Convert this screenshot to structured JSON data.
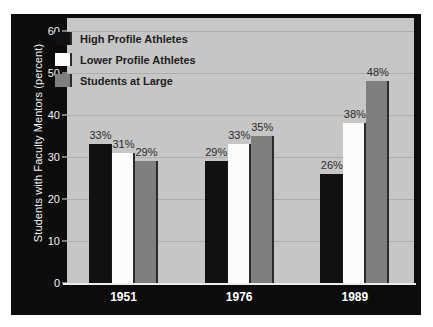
{
  "chart_data": {
    "type": "bar",
    "title": "",
    "subtitle": "",
    "xlabel": "",
    "ylabel": "Students with Faculty Mentors (percent)",
    "categories": [
      "1951",
      "1976",
      "1989"
    ],
    "series": [
      {
        "name": "High Profile Athletes",
        "color": "#111111",
        "values": [
          33,
          29,
          26
        ],
        "labels": [
          "33%",
          "29%",
          "26%"
        ]
      },
      {
        "name": "Lower Profile Athletes",
        "color": "#fbfbfb",
        "values": [
          31,
          33,
          38
        ],
        "labels": [
          "31%",
          "33%",
          "38%"
        ]
      },
      {
        "name": "Students at Large",
        "color": "#7f7f7f",
        "values": [
          29,
          35,
          48
        ],
        "labels": [
          "29%",
          "35%",
          "48%"
        ]
      }
    ],
    "ylim": [
      0,
      63
    ],
    "yticks": [
      0,
      10,
      20,
      30,
      40,
      50,
      60
    ],
    "ytick_labels": [
      "0",
      "10",
      "20",
      "30",
      "40",
      "50",
      "60"
    ],
    "grid": true,
    "grid_axis": "y",
    "legend_position": "upper left",
    "plot_background": "#c6c6c6",
    "panel_background": "#0c0c0c",
    "gridline_color": "#aeaeae",
    "axis_text_color": "#f4f4f4",
    "bar_label_color": "#2a2a2a"
  },
  "legend": {
    "items": [
      {
        "label": "High Profile Athletes",
        "swatch": "dark"
      },
      {
        "label": "Lower Profile Athletes",
        "swatch": "white"
      },
      {
        "label": "Students at Large",
        "swatch": "gray"
      }
    ]
  }
}
